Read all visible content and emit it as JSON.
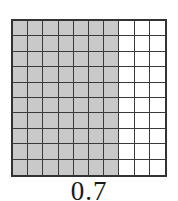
{
  "figure": {
    "caption": "0.7",
    "colors": {
      "shaded_cell": "#c9c9c9",
      "unshaded_cell": "#ffffff",
      "grid_line": "#3a3a3a",
      "border": "#333333",
      "background": "#ffffff",
      "caption_text": "#1a1a1a"
    }
  },
  "chart_data": {
    "type": "heatmap",
    "title": "0.7",
    "subtitle": "",
    "xlabel": "",
    "ylabel": "",
    "rows": 10,
    "columns": 10,
    "total_cells": 100,
    "shaded_cells": 70,
    "unshaded_cells": 30,
    "shaded_fraction": 0.7,
    "shaded_percent": 70,
    "legend": [],
    "annotations": [
      "0.7"
    ],
    "grid": true,
    "values": [
      [
        1,
        1,
        1,
        1,
        1,
        1,
        1,
        0,
        0,
        0
      ],
      [
        1,
        1,
        1,
        1,
        1,
        1,
        1,
        0,
        0,
        0
      ],
      [
        1,
        1,
        1,
        1,
        1,
        1,
        1,
        0,
        0,
        0
      ],
      [
        1,
        1,
        1,
        1,
        1,
        1,
        1,
        0,
        0,
        0
      ],
      [
        1,
        1,
        1,
        1,
        1,
        1,
        1,
        0,
        0,
        0
      ],
      [
        1,
        1,
        1,
        1,
        1,
        1,
        1,
        0,
        0,
        0
      ],
      [
        1,
        1,
        1,
        1,
        1,
        1,
        1,
        0,
        0,
        0
      ],
      [
        1,
        1,
        1,
        1,
        1,
        1,
        1,
        0,
        0,
        0
      ],
      [
        1,
        1,
        1,
        1,
        1,
        1,
        1,
        0,
        0,
        0
      ],
      [
        1,
        1,
        1,
        1,
        1,
        1,
        1,
        0,
        0,
        0
      ]
    ]
  }
}
